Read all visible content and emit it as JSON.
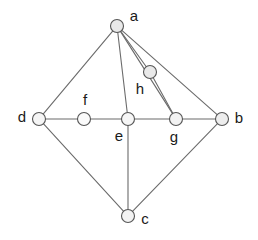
{
  "diagram": {
    "type": "node-link-graph",
    "background_color": "#ffffff",
    "edge_color": "#6b6b6b",
    "node_stroke_color": "#555555",
    "label_color": "#1a1a1a",
    "canvas": {
      "width": 258,
      "height": 240
    },
    "nodes": [
      {
        "id": "a",
        "label": "a",
        "x": 117,
        "y": 26,
        "r": 6.5,
        "fill": "#e9e9e9",
        "label_x": 134,
        "label_y": 17
      },
      {
        "id": "b",
        "label": "b",
        "x": 222,
        "y": 119,
        "r": 6.5,
        "fill": "#ededed",
        "label_x": 239,
        "label_y": 119
      },
      {
        "id": "c",
        "label": "c",
        "x": 128,
        "y": 216,
        "r": 6.5,
        "fill": "#f3f3f3",
        "label_x": 145,
        "label_y": 220
      },
      {
        "id": "d",
        "label": "d",
        "x": 39,
        "y": 119,
        "r": 6.5,
        "fill": "#f5f5f5",
        "label_x": 22,
        "label_y": 118
      },
      {
        "id": "e",
        "label": "e",
        "x": 128,
        "y": 119,
        "r": 6.5,
        "fill": "#f6f6f6",
        "label_x": 119,
        "label_y": 137
      },
      {
        "id": "f",
        "label": "f",
        "x": 84,
        "y": 119,
        "r": 6.5,
        "fill": "#fbfbfb",
        "label_x": 85,
        "label_y": 101
      },
      {
        "id": "g",
        "label": "g",
        "x": 176,
        "y": 119,
        "r": 6.5,
        "fill": "#f2f2f2",
        "label_x": 174,
        "label_y": 138
      },
      {
        "id": "h",
        "label": "h",
        "x": 150,
        "y": 72,
        "r": 6.5,
        "fill": "#e9e9e9",
        "label_x": 140,
        "label_y": 90
      }
    ],
    "edges": [
      {
        "from": "a",
        "to": "d"
      },
      {
        "from": "a",
        "to": "e"
      },
      {
        "from": "a",
        "to": "h"
      },
      {
        "from": "a",
        "to": "g"
      },
      {
        "from": "a",
        "to": "b"
      },
      {
        "from": "h",
        "to": "g"
      },
      {
        "from": "d",
        "to": "f"
      },
      {
        "from": "f",
        "to": "e"
      },
      {
        "from": "e",
        "to": "g"
      },
      {
        "from": "g",
        "to": "b"
      },
      {
        "from": "d",
        "to": "c"
      },
      {
        "from": "e",
        "to": "c"
      },
      {
        "from": "c",
        "to": "b"
      }
    ]
  }
}
